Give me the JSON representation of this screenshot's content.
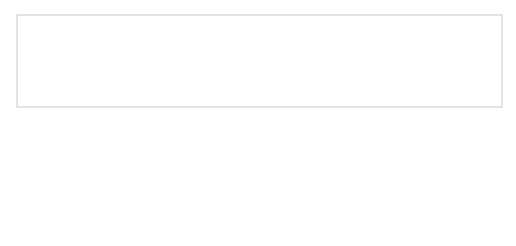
{
  "diagram": {
    "modules": [
      {
        "id": "java.se",
        "label": "java.se",
        "x": 187,
        "y": 24,
        "w": 27,
        "h": 23
      },
      {
        "id": "java.sql.rowset",
        "label": "java.sql.rowset",
        "x": 180,
        "y": 66,
        "w": 42,
        "h": 23
      },
      {
        "id": "java.xml.crypto",
        "label": "java.xml.crypto",
        "x": 235,
        "y": 66,
        "w": 45,
        "h": 23
      },
      {
        "id": "java.management.rmi",
        "label_line1": "java.",
        "label_line2": "management.rmi",
        "x": 295,
        "y": 66,
        "w": 47,
        "h": 25
      },
      {
        "id": "java.prefs",
        "label": "java.prefs",
        "x": 351,
        "y": 66,
        "w": 29,
        "h": 25
      },
      {
        "id": "java.security.sasl",
        "label": "java.security.sasl",
        "x": 407,
        "y": 66,
        "w": 46,
        "h": 25
      },
      {
        "id": "java.sql",
        "label": "java.sql",
        "x": 187,
        "y": 108,
        "w": 27,
        "h": 25
      },
      {
        "id": "java.desktop",
        "label": "java.desktop",
        "x": 225,
        "y": 108,
        "w": 37,
        "h": 25
      },
      {
        "id": "java.management",
        "label_line1": "java.",
        "label_line2": "management",
        "x": 284,
        "y": 108,
        "w": 41,
        "h": 25
      },
      {
        "id": "java.security.jgss",
        "label": "java.security.jgss",
        "x": 377,
        "y": 108,
        "w": 48,
        "h": 25
      },
      {
        "id": "java.scripting",
        "label": "java.scripting",
        "x": 62,
        "y": 150,
        "w": 43,
        "h": 25
      },
      {
        "id": "java.naming",
        "label": "java.naming",
        "x": 108,
        "y": 150,
        "w": 38,
        "h": 25
      },
      {
        "id": "java.logging",
        "label": "java.logging",
        "x": 149,
        "y": 150,
        "w": 35,
        "h": 25
      },
      {
        "id": "java.xml",
        "label": "java.xml",
        "x": 187,
        "y": 150,
        "w": 27,
        "h": 25
      },
      {
        "id": "java.datatransfer",
        "label": "java.datatransfer",
        "x": 218,
        "y": 150,
        "w": 52,
        "h": 25
      },
      {
        "id": "java.compiler",
        "label": "java.compiler",
        "x": 273,
        "y": 150,
        "w": 43,
        "h": 25
      },
      {
        "id": "java.instrument",
        "label": "java.instrument",
        "x": 322,
        "y": 150,
        "w": 48,
        "h": 25
      },
      {
        "id": "java.rmi",
        "label": "java.rmi",
        "x": 384,
        "y": 150,
        "w": 28,
        "h": 25
      },
      {
        "id": "java.base",
        "label": "java.base",
        "x": 187,
        "y": 193,
        "w": 28,
        "h": 23
      }
    ],
    "colors": {
      "box_fill": "#a9a9a9",
      "box_stroke": "#2b2b2b",
      "edge": "#2a2a2a",
      "frame": "#c8c8c8",
      "background": "#ffffff"
    }
  }
}
